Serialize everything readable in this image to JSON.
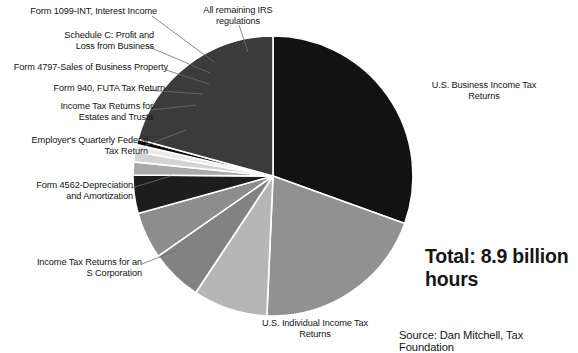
{
  "chart_data": {
    "type": "pie",
    "title": "",
    "subtitle": "",
    "total_label": "Total: 8.9\nbillion hours",
    "total_value": 8.9,
    "total_units": "billion hours",
    "source": "Source: Dan Mitchell, Tax Foundation",
    "legend_position": "callout-labels",
    "grid": false,
    "units": "billion hours",
    "categories": [
      "U.S. Business Income Tax Returns",
      "U.S. Individual Income Tax Returns",
      "Income Tax Returns for an S Corporation",
      "Form 4562-Depreciation and Amortization",
      "Employer's Quarterly Federal Tax Return",
      "Income Tax Returns for Estates and Trusts",
      "Form 940, FUTA Tax Return",
      "Form 4797-Sales of Business Property",
      "Schedule C: Profit and Loss from Business",
      "Form 1099-INT, Interest Income",
      "All remaining IRS regulations"
    ],
    "values": [
      30.5,
      20.2,
      8.6,
      6.0,
      5.4,
      4.4,
      1.5,
      1.2,
      0.8,
      0.6,
      20.8
    ],
    "colors": [
      "#121212",
      "#919191",
      "#b6b6b6",
      "#828282",
      "#8d8d8d",
      "#1d1d1d",
      "#a9a9a9",
      "#d4d4d4",
      "#eaeaea",
      "#0d0d0d",
      "#3b3b3b"
    ],
    "slices": [
      {
        "label": "U.S. Business Income Tax Returns",
        "percent": 30.5,
        "color": "#121212",
        "start_deg": 0,
        "end_deg": 109.8
      },
      {
        "label": "U.S. Individual Income Tax Returns",
        "percent": 20.2,
        "color": "#919191",
        "start_deg": 109.8,
        "end_deg": 182.5
      },
      {
        "label": "Income Tax Returns for an S Corporation",
        "percent": 8.6,
        "color": "#b6b6b6",
        "start_deg": 182.5,
        "end_deg": 213.5
      },
      {
        "label": "Form 4562-Depreciation and Amortization",
        "percent": 6.0,
        "color": "#828282",
        "start_deg": 213.5,
        "end_deg": 235.1
      },
      {
        "label": "Employer's Quarterly Federal Tax Return",
        "percent": 5.4,
        "color": "#8d8d8d",
        "start_deg": 235.1,
        "end_deg": 254.5
      },
      {
        "label": "Income Tax Returns for Estates and Trusts",
        "percent": 4.4,
        "color": "#1d1d1d",
        "start_deg": 254.5,
        "end_deg": 270.4
      },
      {
        "label": "Form 940, FUTA Tax Return",
        "percent": 1.5,
        "color": "#a9a9a9",
        "start_deg": 270.4,
        "end_deg": 275.8
      },
      {
        "label": "Form 4797-Sales of Business Property",
        "percent": 1.2,
        "color": "#d4d4d4",
        "start_deg": 275.8,
        "end_deg": 280.1
      },
      {
        "label": "Schedule C: Profit and Loss from Business",
        "percent": 0.8,
        "color": "#eaeaea",
        "start_deg": 280.1,
        "end_deg": 283.0
      },
      {
        "label": "Form 1099-INT, Interest Income",
        "percent": 0.6,
        "color": "#0d0d0d",
        "start_deg": 283.0,
        "end_deg": 285.2
      },
      {
        "label": "All remaining IRS regulations",
        "percent": 20.8,
        "color": "#3b3b3b",
        "start_deg": 285.2,
        "end_deg": 360
      }
    ]
  },
  "labels": {
    "form_1099_int": "Form 1099-INT, Interest Income",
    "schedule_c": "Schedule C: Profit and\nLoss from Business",
    "form_4797": "Form 4797-Sales of Business Property",
    "form_940": "Form 940, FUTA Tax Return",
    "estates_trusts": "Income Tax Returns for\nEstates and Trusts",
    "employer_quarterly": "Employer's Quarterly Federal\nTax Return",
    "form_4562": "Form 4562-Depreciation\nand Amortization",
    "s_corporation": "Income Tax Returns for an\nS Corporation",
    "all_remaining": "All remaining IRS\nregulations",
    "business_returns": "U.S. Business Income Tax\nReturns",
    "individual_returns": "U.S. Individual Income Tax\nReturns"
  },
  "annotations": {
    "total": "Total: 8.9\nbillion hours",
    "source": "Source: Dan Mitchell, Tax Foundation"
  }
}
